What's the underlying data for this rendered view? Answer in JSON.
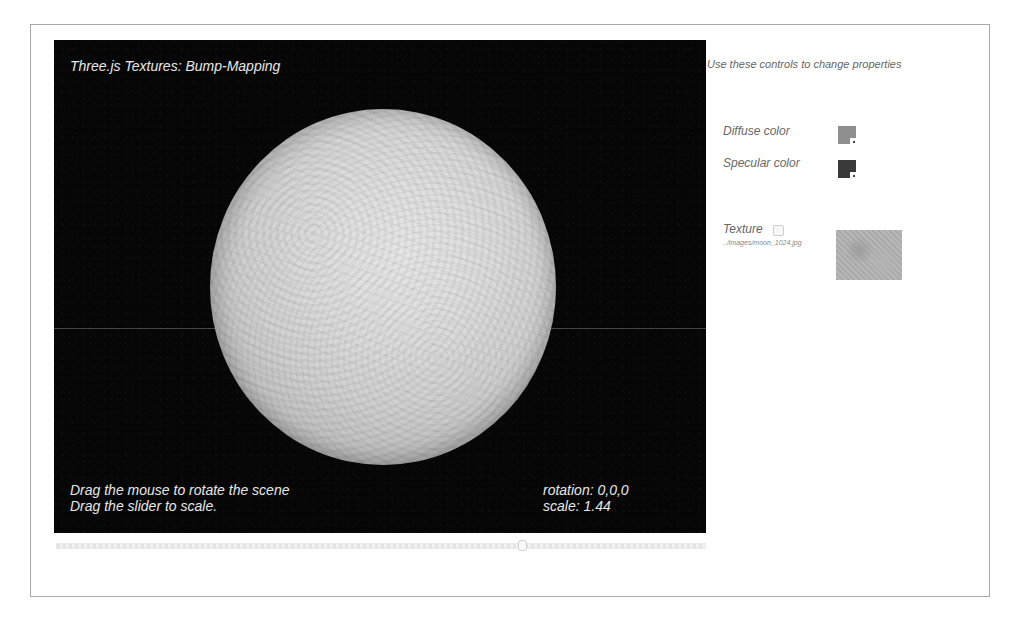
{
  "viewport": {
    "title": "Three.js Textures: Bump-Mapping",
    "instructions": [
      "Drag the mouse to rotate the scene",
      "Drag the slider to scale."
    ],
    "status": {
      "rotation_label": "rotation: 0,0,0",
      "scale_label": "scale: 1.44"
    },
    "background_color": "#060606",
    "object": "sphere-icon"
  },
  "scale_slider": {
    "value": 1.44,
    "thumb_position_pct": 71
  },
  "controls": {
    "intro": "Use these controls to change properties",
    "diffuse": {
      "label": "Diffuse color",
      "color": "#8f8f8f"
    },
    "specular": {
      "label": "Specular color",
      "color": "#3a3a3a"
    },
    "texture": {
      "label": "Texture",
      "checked": false,
      "path": "../images/moon_1024.jpg"
    }
  }
}
